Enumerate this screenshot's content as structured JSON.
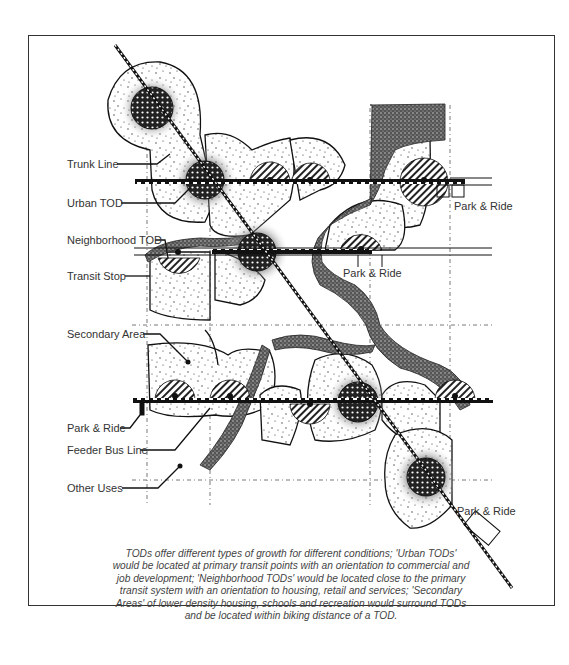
{
  "figure": {
    "labels": {
      "trunk_line": "Trunk Line",
      "urban_tod": "Urban TOD",
      "neighborhood_tod": "Neighborhood TOD",
      "transit_stop": "Transit Stop",
      "secondary_area": "Secondary Area",
      "park_ride_left": "Park & Ride",
      "feeder_bus_line": "Feeder Bus Line",
      "other_uses": "Other Uses",
      "park_ride_top_right": "Park & Ride",
      "park_ride_mid": "Park & Ride",
      "park_ride_bottom_right": "Park & Ride"
    },
    "caption": "TODs offer different types of growth for different conditions; 'Urban TODs' would be located at primary transit points with an orientation to commercial and job development; 'Neighborhood TODs' would be located close to the primary transit system with an orientation to housing, retail and services; 'Secondary Areas' of lower density housing, schools and recreation would surround TODs and be located within biking distance of a TOD.",
    "legend_symbols": {
      "urban_tod": "dotted-dark-circle",
      "neighborhood_tod": "hatched-semicircle",
      "secondary_area": "stippled-region",
      "trunk_line": "diagonal-rail-line",
      "feeder_bus_line": "horizontal-double-line",
      "open_space": "textured-stream"
    }
  }
}
